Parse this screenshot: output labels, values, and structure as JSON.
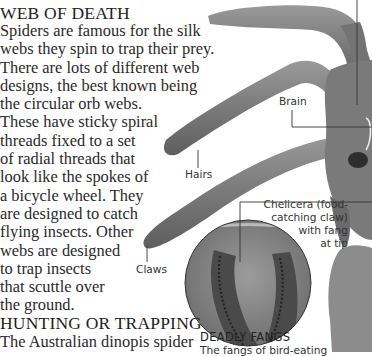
{
  "section1": {
    "heading": "WEB OF DEATH",
    "lines": [
      "Spiders are famous for the silk",
      "webs they spin to trap their prey.",
      "There are lots of different web",
      "designs, the best known being",
      "the circular orb webs.",
      "These have sticky spiral",
      "threads fixed to a set",
      "of radial threads that",
      "look like the spokes of",
      "a bicycle wheel. They",
      "are designed to catch",
      "flying insects. Other",
      "webs are designed",
      "to trap insects",
      "that scuttle over",
      "the ground."
    ]
  },
  "section2": {
    "heading": "HUNTING OR TRAPPING",
    "lines": [
      "The Australian dinopis spider"
    ]
  },
  "labels": {
    "brain": "Brain",
    "hairs": "Hairs",
    "claws": "Claws",
    "chelicera": [
      "Chelicera (food-",
      "catching claw)",
      "with fang",
      "at tip"
    ]
  },
  "caption": {
    "title": "DEADLY FANGS",
    "text": "The fangs of bird-eating"
  },
  "colors": {
    "text": "#2a2a2a",
    "spider_dark": "#5a5a5a",
    "spider_mid": "#8a8a8a",
    "spider_light": "#b5b5b5",
    "background": "#ffffff"
  }
}
